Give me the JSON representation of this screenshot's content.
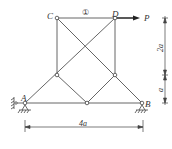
{
  "diagram": {
    "type": "truss",
    "nodes": {
      "A": {
        "label": "A",
        "x": 25,
        "y": 103
      },
      "B": {
        "label": "B",
        "x": 142,
        "y": 103
      },
      "C": {
        "label": "C",
        "x": 57,
        "y": 18
      },
      "D": {
        "label": "D",
        "x": 115,
        "y": 18
      },
      "E": {
        "label": "",
        "x": 57,
        "y": 75
      },
      "F": {
        "label": "",
        "x": 115,
        "y": 75
      },
      "G": {
        "label": "",
        "x": 87,
        "y": 103
      }
    },
    "member_label": "①",
    "load": {
      "label": "P"
    },
    "dimensions": {
      "horizontal": "4a",
      "vertical_upper": "2a",
      "vertical_lower": "a"
    }
  }
}
